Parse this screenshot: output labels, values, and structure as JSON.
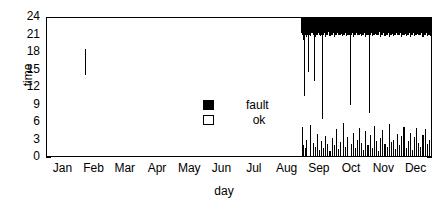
{
  "chart_data": {
    "type": "bar",
    "title": "",
    "subtitle": "",
    "xlabel": "day",
    "ylabel": "time",
    "xlim": [
      0,
      365
    ],
    "ylim": [
      0,
      24
    ],
    "grid": false,
    "legend_position": "center",
    "legend": [
      {
        "label": "fault",
        "marker": "filled-square",
        "color": "#000000"
      },
      {
        "label": "ok",
        "marker": "open-square",
        "color": "#ffffff"
      }
    ],
    "ytick_labels": [
      "0",
      "3",
      "6",
      "9",
      "12",
      "15",
      "18",
      "21",
      "24"
    ],
    "ytick_values": [
      0,
      3,
      6,
      9,
      12,
      15,
      18,
      21,
      24
    ],
    "xtick_labels": [
      "Jan",
      "Feb",
      "Mar",
      "Apr",
      "May",
      "Jun",
      "Jul",
      "Aug",
      "Sep",
      "Oct",
      "Nov",
      "Dec"
    ],
    "xtick_values": [
      0,
      31,
      59,
      90,
      120,
      151,
      181,
      212,
      243,
      273,
      304,
      334
    ],
    "series": [
      {
        "name": "fault",
        "color": "#000000",
        "intervals": [
          {
            "day": 37,
            "t0": 14.0,
            "t1": 18.5
          },
          {
            "day": 241,
            "t0": 21.2,
            "t1": 24.0
          },
          {
            "day": 242,
            "t0": 21.0,
            "t1": 24.0
          },
          {
            "day": 242,
            "t0": 0.0,
            "t1": 5.2
          },
          {
            "day": 243,
            "t0": 20.0,
            "t1": 24.0
          },
          {
            "day": 243,
            "t0": 0.0,
            "t1": 2.0
          },
          {
            "day": 244,
            "t0": 10.5,
            "t1": 24.0
          },
          {
            "day": 245,
            "t0": 21.0,
            "t1": 24.0
          },
          {
            "day": 245,
            "t0": 0.0,
            "t1": 1.6
          },
          {
            "day": 246,
            "t0": 20.5,
            "t1": 24.0
          },
          {
            "day": 246,
            "t0": 0.0,
            "t1": 3.0
          },
          {
            "day": 247,
            "t0": 21.0,
            "t1": 24.0
          },
          {
            "day": 248,
            "t0": 14.5,
            "t1": 24.0
          },
          {
            "day": 249,
            "t0": 21.0,
            "t1": 24.0
          },
          {
            "day": 250,
            "t0": 20.8,
            "t1": 24.0
          },
          {
            "day": 250,
            "t0": 0.0,
            "t1": 5.5
          },
          {
            "day": 251,
            "t0": 21.2,
            "t1": 24.0
          },
          {
            "day": 252,
            "t0": 21.0,
            "t1": 24.0
          },
          {
            "day": 252,
            "t0": 0.0,
            "t1": 2.4
          },
          {
            "day": 253,
            "t0": 13.0,
            "t1": 24.0
          },
          {
            "day": 254,
            "t0": 20.5,
            "t1": 24.0
          },
          {
            "day": 254,
            "t0": 0.0,
            "t1": 1.8
          },
          {
            "day": 255,
            "t0": 21.0,
            "t1": 24.0
          },
          {
            "day": 256,
            "t0": 21.0,
            "t1": 24.0
          },
          {
            "day": 256,
            "t0": 0.0,
            "t1": 4.0
          },
          {
            "day": 257,
            "t0": 21.3,
            "t1": 24.0
          },
          {
            "day": 258,
            "t0": 21.0,
            "t1": 24.0
          },
          {
            "day": 258,
            "t0": 0.0,
            "t1": 1.2
          },
          {
            "day": 259,
            "t0": 20.8,
            "t1": 24.0
          },
          {
            "day": 260,
            "t0": 21.0,
            "t1": 24.0
          },
          {
            "day": 260,
            "t0": 0.0,
            "t1": 2.8
          },
          {
            "day": 261,
            "t0": 6.5,
            "t1": 24.0
          },
          {
            "day": 262,
            "t0": 21.0,
            "t1": 24.0
          },
          {
            "day": 262,
            "t0": 0.0,
            "t1": 1.5
          },
          {
            "day": 263,
            "t0": 21.2,
            "t1": 24.0
          },
          {
            "day": 264,
            "t0": 20.6,
            "t1": 24.0
          },
          {
            "day": 264,
            "t0": 0.0,
            "t1": 3.6
          },
          {
            "day": 265,
            "t0": 21.0,
            "t1": 24.0
          },
          {
            "day": 266,
            "t0": 21.0,
            "t1": 24.0
          },
          {
            "day": 266,
            "t0": 0.0,
            "t1": 2.2
          },
          {
            "day": 267,
            "t0": 21.4,
            "t1": 24.0
          },
          {
            "day": 268,
            "t0": 20.8,
            "t1": 24.0
          },
          {
            "day": 268,
            "t0": 0.0,
            "t1": 1.0
          },
          {
            "day": 269,
            "t0": 21.0,
            "t1": 24.0
          },
          {
            "day": 270,
            "t0": 21.0,
            "t1": 24.0
          },
          {
            "day": 270,
            "t0": 0.0,
            "t1": 3.2
          },
          {
            "day": 271,
            "t0": 21.2,
            "t1": 24.0
          },
          {
            "day": 272,
            "t0": 20.5,
            "t1": 24.0
          },
          {
            "day": 272,
            "t0": 0.0,
            "t1": 2.0
          },
          {
            "day": 273,
            "t0": 21.0,
            "t1": 24.0
          },
          {
            "day": 274,
            "t0": 21.0,
            "t1": 24.0
          },
          {
            "day": 274,
            "t0": 0.0,
            "t1": 4.8
          },
          {
            "day": 275,
            "t0": 21.3,
            "t1": 24.0
          },
          {
            "day": 276,
            "t0": 21.0,
            "t1": 24.0
          },
          {
            "day": 276,
            "t0": 0.0,
            "t1": 1.4
          },
          {
            "day": 277,
            "t0": 20.9,
            "t1": 24.0
          },
          {
            "day": 278,
            "t0": 21.0,
            "t1": 24.0
          },
          {
            "day": 278,
            "t0": 0.0,
            "t1": 2.6
          },
          {
            "day": 279,
            "t0": 21.1,
            "t1": 24.0
          },
          {
            "day": 280,
            "t0": 20.7,
            "t1": 24.0
          },
          {
            "day": 281,
            "t0": 21.0,
            "t1": 24.0
          },
          {
            "day": 281,
            "t0": 0.0,
            "t1": 5.8
          },
          {
            "day": 282,
            "t0": 21.0,
            "t1": 24.0
          },
          {
            "day": 283,
            "t0": 21.2,
            "t1": 24.0
          },
          {
            "day": 283,
            "t0": 0.0,
            "t1": 1.8
          },
          {
            "day": 284,
            "t0": 20.8,
            "t1": 24.0
          },
          {
            "day": 285,
            "t0": 21.0,
            "t1": 24.0
          },
          {
            "day": 285,
            "t0": 0.0,
            "t1": 3.4
          },
          {
            "day": 286,
            "t0": 21.0,
            "t1": 24.0
          },
          {
            "day": 287,
            "t0": 9.0,
            "t1": 24.0
          },
          {
            "day": 288,
            "t0": 21.0,
            "t1": 24.0
          },
          {
            "day": 288,
            "t0": 0.0,
            "t1": 2.2
          },
          {
            "day": 289,
            "t0": 21.3,
            "t1": 24.0
          },
          {
            "day": 290,
            "t0": 20.6,
            "t1": 24.0
          },
          {
            "day": 290,
            "t0": 0.0,
            "t1": 4.2
          },
          {
            "day": 291,
            "t0": 21.0,
            "t1": 24.0
          },
          {
            "day": 292,
            "t0": 21.0,
            "t1": 24.0
          },
          {
            "day": 292,
            "t0": 0.0,
            "t1": 1.6
          },
          {
            "day": 293,
            "t0": 21.2,
            "t1": 24.0
          },
          {
            "day": 294,
            "t0": 20.9,
            "t1": 24.0
          },
          {
            "day": 294,
            "t0": 0.0,
            "t1": 3.0
          },
          {
            "day": 295,
            "t0": 21.0,
            "t1": 24.0
          },
          {
            "day": 296,
            "t0": 21.0,
            "t1": 24.0
          },
          {
            "day": 296,
            "t0": 0.0,
            "t1": 5.0
          },
          {
            "day": 297,
            "t0": 21.1,
            "t1": 24.0
          },
          {
            "day": 298,
            "t0": 20.8,
            "t1": 24.0
          },
          {
            "day": 298,
            "t0": 0.0,
            "t1": 2.4
          },
          {
            "day": 299,
            "t0": 21.0,
            "t1": 24.0
          },
          {
            "day": 300,
            "t0": 21.0,
            "t1": 24.0
          },
          {
            "day": 300,
            "t0": 0.0,
            "t1": 1.2
          },
          {
            "day": 301,
            "t0": 21.3,
            "t1": 24.0
          },
          {
            "day": 302,
            "t0": 20.5,
            "t1": 24.0
          },
          {
            "day": 302,
            "t0": 0.0,
            "t1": 4.4
          },
          {
            "day": 303,
            "t0": 21.0,
            "t1": 24.0
          },
          {
            "day": 304,
            "t0": 21.0,
            "t1": 24.0
          },
          {
            "day": 304,
            "t0": 0.0,
            "t1": 2.0
          },
          {
            "day": 305,
            "t0": 7.5,
            "t1": 24.0
          },
          {
            "day": 306,
            "t0": 21.0,
            "t1": 24.0
          },
          {
            "day": 306,
            "t0": 0.0,
            "t1": 3.8
          },
          {
            "day": 307,
            "t0": 21.2,
            "t1": 24.0
          },
          {
            "day": 308,
            "t0": 20.7,
            "t1": 24.0
          },
          {
            "day": 308,
            "t0": 0.0,
            "t1": 1.5
          },
          {
            "day": 309,
            "t0": 21.0,
            "t1": 24.0
          },
          {
            "day": 310,
            "t0": 21.0,
            "t1": 24.0
          },
          {
            "day": 310,
            "t0": 0.0,
            "t1": 5.4
          },
          {
            "day": 311,
            "t0": 21.1,
            "t1": 24.0
          },
          {
            "day": 312,
            "t0": 20.9,
            "t1": 24.0
          },
          {
            "day": 312,
            "t0": 0.0,
            "t1": 2.8
          },
          {
            "day": 313,
            "t0": 21.0,
            "t1": 24.0
          },
          {
            "day": 314,
            "t0": 21.0,
            "t1": 24.0
          },
          {
            "day": 314,
            "t0": 0.0,
            "t1": 1.0
          },
          {
            "day": 315,
            "t0": 21.4,
            "t1": 24.0
          },
          {
            "day": 316,
            "t0": 20.6,
            "t1": 24.0
          },
          {
            "day": 316,
            "t0": 0.0,
            "t1": 3.2
          },
          {
            "day": 317,
            "t0": 21.0,
            "t1": 24.0
          },
          {
            "day": 318,
            "t0": 21.0,
            "t1": 24.0
          },
          {
            "day": 318,
            "t0": 0.0,
            "t1": 4.6
          },
          {
            "day": 319,
            "t0": 21.2,
            "t1": 24.0
          },
          {
            "day": 320,
            "t0": 20.8,
            "t1": 24.0
          },
          {
            "day": 320,
            "t0": 0.0,
            "t1": 2.2
          },
          {
            "day": 321,
            "t0": 21.0,
            "t1": 24.0
          },
          {
            "day": 322,
            "t0": 21.0,
            "t1": 24.0
          },
          {
            "day": 322,
            "t0": 0.0,
            "t1": 1.8
          },
          {
            "day": 323,
            "t0": 21.3,
            "t1": 24.0
          },
          {
            "day": 324,
            "t0": 20.5,
            "t1": 24.0
          },
          {
            "day": 324,
            "t0": 0.0,
            "t1": 5.6
          },
          {
            "day": 325,
            "t0": 21.0,
            "t1": 24.0
          },
          {
            "day": 326,
            "t0": 21.0,
            "t1": 24.0
          },
          {
            "day": 326,
            "t0": 0.0,
            "t1": 2.6
          },
          {
            "day": 327,
            "t0": 21.1,
            "t1": 24.0
          },
          {
            "day": 328,
            "t0": 20.7,
            "t1": 24.0
          },
          {
            "day": 328,
            "t0": 0.0,
            "t1": 3.0
          },
          {
            "day": 329,
            "t0": 21.0,
            "t1": 24.0
          },
          {
            "day": 330,
            "t0": 21.0,
            "t1": 24.0
          },
          {
            "day": 330,
            "t0": 0.0,
            "t1": 1.4
          },
          {
            "day": 331,
            "t0": 21.2,
            "t1": 24.0
          },
          {
            "day": 332,
            "t0": 20.9,
            "t1": 24.0
          },
          {
            "day": 332,
            "t0": 0.0,
            "t1": 4.0
          },
          {
            "day": 333,
            "t0": 21.0,
            "t1": 24.0
          },
          {
            "day": 334,
            "t0": 21.0,
            "t1": 24.0
          },
          {
            "day": 334,
            "t0": 0.0,
            "t1": 2.0
          },
          {
            "day": 335,
            "t0": 21.3,
            "t1": 24.0
          },
          {
            "day": 336,
            "t0": 20.6,
            "t1": 24.0
          },
          {
            "day": 336,
            "t0": 0.0,
            "t1": 3.6
          },
          {
            "day": 337,
            "t0": 21.0,
            "t1": 24.0
          },
          {
            "day": 338,
            "t0": 21.0,
            "t1": 24.0
          },
          {
            "day": 338,
            "t0": 0.0,
            "t1": 5.2
          },
          {
            "day": 339,
            "t0": 21.1,
            "t1": 24.0
          },
          {
            "day": 340,
            "t0": 20.8,
            "t1": 24.0
          },
          {
            "day": 340,
            "t0": 0.0,
            "t1": 1.6
          },
          {
            "day": 341,
            "t0": 21.0,
            "t1": 24.0
          },
          {
            "day": 342,
            "t0": 21.0,
            "t1": 24.0
          },
          {
            "day": 342,
            "t0": 0.0,
            "t1": 2.8
          },
          {
            "day": 343,
            "t0": 21.2,
            "t1": 24.0
          },
          {
            "day": 344,
            "t0": 20.5,
            "t1": 24.0
          },
          {
            "day": 344,
            "t0": 0.0,
            "t1": 4.2
          },
          {
            "day": 345,
            "t0": 21.0,
            "t1": 24.0
          },
          {
            "day": 346,
            "t0": 21.0,
            "t1": 24.0
          },
          {
            "day": 346,
            "t0": 0.0,
            "t1": 1.2
          },
          {
            "day": 347,
            "t0": 21.3,
            "t1": 24.0
          },
          {
            "day": 348,
            "t0": 20.7,
            "t1": 24.0
          },
          {
            "day": 348,
            "t0": 0.0,
            "t1": 3.4
          },
          {
            "day": 349,
            "t0": 21.0,
            "t1": 24.0
          },
          {
            "day": 350,
            "t0": 21.0,
            "t1": 24.0
          },
          {
            "day": 350,
            "t0": 0.0,
            "t1": 5.0
          },
          {
            "day": 351,
            "t0": 21.1,
            "t1": 24.0
          },
          {
            "day": 352,
            "t0": 20.9,
            "t1": 24.0
          },
          {
            "day": 352,
            "t0": 0.0,
            "t1": 2.4
          },
          {
            "day": 353,
            "t0": 21.0,
            "t1": 24.0
          },
          {
            "day": 354,
            "t0": 21.0,
            "t1": 24.0
          },
          {
            "day": 354,
            "t0": 0.0,
            "t1": 1.8
          },
          {
            "day": 355,
            "t0": 21.2,
            "t1": 24.0
          },
          {
            "day": 356,
            "t0": 20.6,
            "t1": 24.0
          },
          {
            "day": 356,
            "t0": 0.0,
            "t1": 3.8
          },
          {
            "day": 357,
            "t0": 21.0,
            "t1": 24.0
          },
          {
            "day": 358,
            "t0": 21.0,
            "t1": 24.0
          },
          {
            "day": 358,
            "t0": 0.0,
            "t1": 4.8
          },
          {
            "day": 359,
            "t0": 21.3,
            "t1": 24.0
          },
          {
            "day": 360,
            "t0": 20.8,
            "t1": 24.0
          },
          {
            "day": 360,
            "t0": 0.0,
            "t1": 2.2
          },
          {
            "day": 361,
            "t0": 21.0,
            "t1": 24.0
          },
          {
            "day": 362,
            "t0": 21.0,
            "t1": 24.0
          },
          {
            "day": 362,
            "t0": 0.0,
            "t1": 3.0
          },
          {
            "day": 363,
            "t0": 20.7,
            "t1": 24.0
          },
          {
            "day": 364,
            "t0": 21.0,
            "t1": 24.0
          },
          {
            "day": 364,
            "t0": 0.0,
            "t1": 1.5
          }
        ]
      }
    ]
  }
}
